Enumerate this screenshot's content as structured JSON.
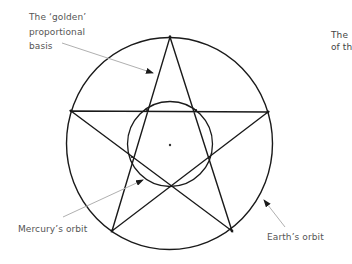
{
  "diagram": {
    "labels": {
      "golden_basis": [
        "The ‘golden’",
        "proportional",
        "basis"
      ],
      "mercury_orbit": "Mercury’s orbit",
      "earth_orbit": "Earth’s orbit",
      "side_text": [
        "The",
        "of th"
      ]
    },
    "shapes": {
      "earth_orbit_circle": {
        "cx": 169.5,
        "cy": 143.5,
        "rx": 103,
        "ry": 106
      },
      "mercury_orbit_circle": {
        "cx": 170,
        "cy": 144,
        "r": 42.5
      },
      "center_point": {
        "x": 170,
        "y": 145
      },
      "pentagram_vertices": [
        [
          170,
          37
        ],
        [
          268,
          112
        ],
        [
          232,
          231
        ],
        [
          112,
          231
        ],
        [
          71,
          111
        ]
      ]
    },
    "colors": {
      "line": "#1a1a1a",
      "arrow": "#b0b0b0",
      "text": "#555555",
      "background": "#ffffff"
    }
  }
}
